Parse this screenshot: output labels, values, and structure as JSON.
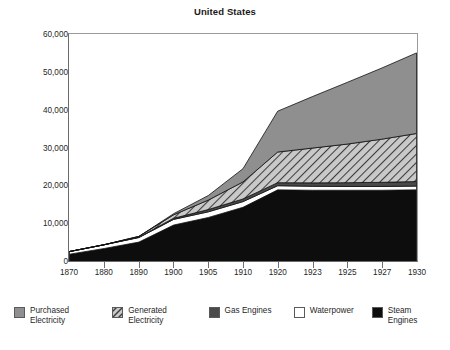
{
  "chart_data": {
    "type": "area",
    "title": "United States",
    "xlabel": "",
    "ylabel": "",
    "stacked": true,
    "grid": false,
    "legend_position": "bottom",
    "ylim": [
      0,
      60000
    ],
    "yticks": [
      0,
      10000,
      20000,
      30000,
      40000,
      50000,
      60000
    ],
    "ytick_labels": [
      "0",
      "10,000",
      "20,000",
      "30,000",
      "40,000",
      "50,000",
      "60,000"
    ],
    "categories": [
      "1870",
      "1880",
      "1890",
      "1900",
      "1905",
      "1910",
      "1920",
      "1923",
      "1925",
      "1927",
      "1930"
    ],
    "x": [
      1870,
      1880,
      1890,
      1900,
      1905,
      1910,
      1920,
      1923,
      1925,
      1927,
      1930
    ],
    "series": [
      {
        "name": "Steam Engines",
        "color": "#0d0d0d",
        "pattern": "solid",
        "values": [
          1800,
          3300,
          5000,
          9500,
          11500,
          14200,
          18800,
          18700,
          18700,
          18700,
          18800
        ]
      },
      {
        "name": "Waterpower",
        "color": "#ffffff",
        "pattern": "solid",
        "values": [
          700,
          1000,
          1200,
          1500,
          1500,
          1500,
          1100,
          1050,
          1000,
          1000,
          1000
        ]
      },
      {
        "name": "Gas Engines",
        "color": "#4a4a4a",
        "pattern": "solid",
        "values": [
          0,
          0,
          100,
          300,
          600,
          700,
          800,
          900,
          1000,
          1100,
          1200
        ]
      },
      {
        "name": "Generated Electricity",
        "color": "#a8a8a8",
        "pattern": "diagonal-hatch",
        "values": [
          0,
          0,
          200,
          900,
          2500,
          4500,
          8100,
          9200,
          10200,
          11400,
          12700
        ]
      },
      {
        "name": "Purchased Electricity",
        "color": "#8f8f8f",
        "pattern": "solid",
        "values": [
          0,
          0,
          0,
          300,
          1200,
          3500,
          10800,
          13600,
          16300,
          18800,
          21300
        ]
      }
    ],
    "totals": [
      2500,
      4300,
      6500,
      12500,
      17300,
      24400,
      39600,
      43450,
      47200,
      51000,
      55000
    ]
  },
  "legend": {
    "items": [
      {
        "label": "Purchased\nElectricity",
        "swatch": "purchased-electricity-swatch"
      },
      {
        "label": "Generated\nElectricity",
        "swatch": "generated-electricity-swatch"
      },
      {
        "label": "Gas Engines",
        "swatch": "gas-engines-swatch"
      },
      {
        "label": "Waterpower",
        "swatch": "waterpower-swatch"
      },
      {
        "label": "Steam Engines",
        "swatch": "steam-engines-swatch"
      }
    ]
  },
  "colors": {
    "purchased_electricity": "#8f8f8f",
    "generated_electricity": "#a8a8a8",
    "gas_engines": "#4a4a4a",
    "waterpower": "#ffffff",
    "steam_engines": "#0d0d0d",
    "axis": "#6f6f6f",
    "text": "#1f1f1f"
  }
}
